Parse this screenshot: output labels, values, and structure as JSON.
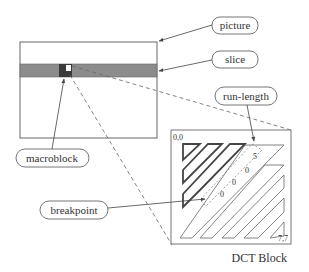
{
  "diagram": {
    "labels": {
      "picture": "picture",
      "slice": "slice",
      "run_length": "run-length",
      "macroblock": "macroblock",
      "breakpoint": "breakpoint",
      "caption": "DCT Block"
    },
    "dct_block": {
      "corner_top_left": "0,0",
      "corner_bottom_right": "7,7",
      "run_values": [
        "0",
        "0",
        "0",
        "5"
      ]
    },
    "colors": {
      "line": "#555555",
      "slice_fill": "#8c8c8c",
      "macroblock_fill": "#3a3a3a",
      "highlight": "#ffffff",
      "dashed": "#666666"
    }
  }
}
